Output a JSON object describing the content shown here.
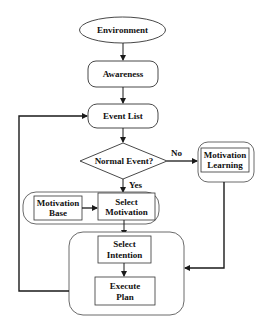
{
  "diagram": {
    "type": "flowchart",
    "nodes": {
      "environment": {
        "label": "Environment",
        "shape": "ellipse"
      },
      "awareness": {
        "label": "Awareness",
        "shape": "rounded-rect"
      },
      "event_list": {
        "label": "Event List",
        "shape": "rounded-rect"
      },
      "normal_event": {
        "label": "Normal Event?",
        "shape": "diamond"
      },
      "motivation_learning": {
        "line1": "Motivation",
        "line2": "Learning",
        "shape": "rect-in-rounded-rect"
      },
      "motivation_base": {
        "line1": "Motivation",
        "line2": "Base",
        "shape": "rect"
      },
      "select_motivation": {
        "line1": "Select",
        "line2": "Motivation",
        "shape": "rect"
      },
      "select_intention": {
        "line1": "Select",
        "line2": "Intention",
        "shape": "rect"
      },
      "execute_plan": {
        "line1": "Execute",
        "line2": "Plan",
        "shape": "rect"
      }
    },
    "edge_labels": {
      "no": "No",
      "yes": "Yes"
    },
    "edges": [
      {
        "from": "environment",
        "to": "awareness"
      },
      {
        "from": "awareness",
        "to": "event_list"
      },
      {
        "from": "event_list",
        "to": "normal_event"
      },
      {
        "from": "normal_event",
        "to": "motivation_learning",
        "label": "No"
      },
      {
        "from": "normal_event",
        "to": "select_motivation",
        "label": "Yes"
      },
      {
        "from": "motivation_base",
        "to": "select_motivation"
      },
      {
        "from": "select_motivation",
        "to": "select_intention"
      },
      {
        "from": "select_intention",
        "to": "execute_plan"
      },
      {
        "from": "motivation_learning",
        "to": "intention_group"
      },
      {
        "from": "intention_group",
        "to": "event_list"
      }
    ],
    "colors": {
      "stroke": "#1a1a1a",
      "fill": "#ffffff",
      "text": "#111111"
    }
  }
}
